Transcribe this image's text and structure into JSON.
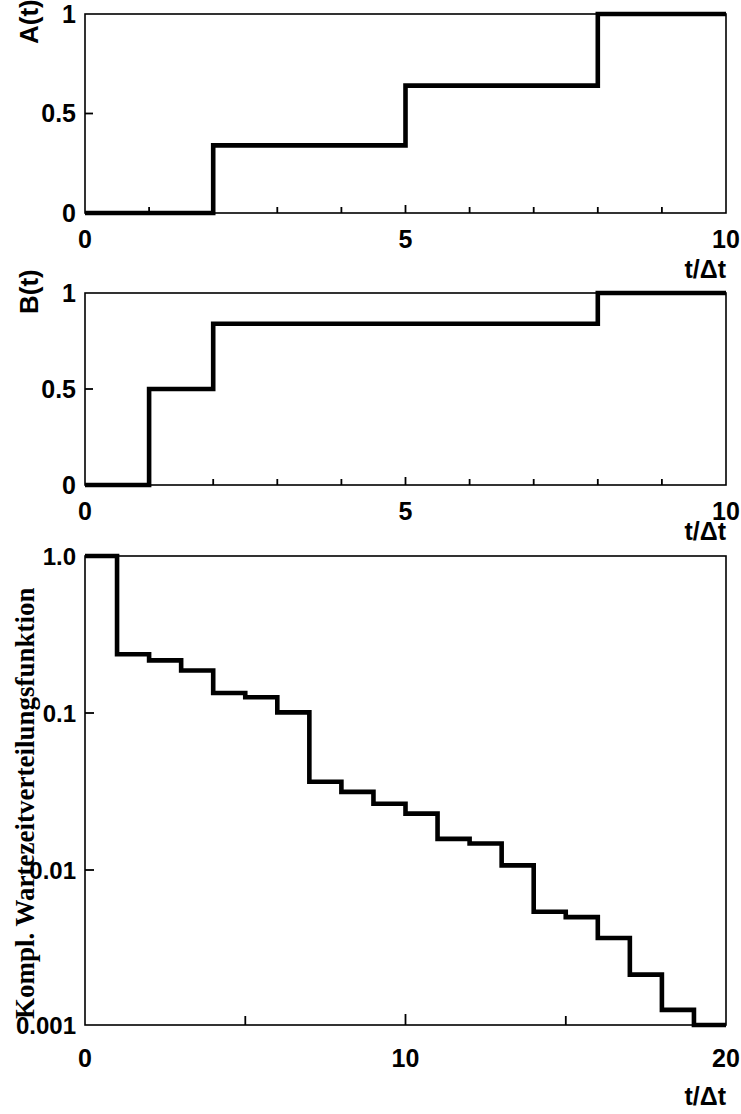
{
  "figure": {
    "background": "#ffffff",
    "ink": "#000000"
  },
  "panels": {
    "a": {
      "ylabel": "A(t)",
      "xlabel": "t/Δt",
      "y_ticks": [
        "0",
        "0.5",
        "1"
      ],
      "x_ticks": [
        "0",
        "5",
        "10"
      ]
    },
    "b": {
      "ylabel": "B(t)",
      "xlabel": "t/Δt",
      "y_ticks": [
        "0",
        "0.5",
        "1"
      ],
      "x_ticks": [
        "0",
        "5",
        "10"
      ]
    },
    "c": {
      "ylabel": "Kompl. Wartezeitverteilungsfunktion",
      "xlabel": "t/Δt",
      "y_ticks": [
        "0.001",
        "0.01",
        "0.1",
        "1.0"
      ],
      "x_ticks": [
        "0",
        "10",
        "20"
      ]
    }
  },
  "chart_data": [
    {
      "type": "line",
      "id": "panel-a",
      "title": "",
      "subtitle": "",
      "xlabel": "t/Δt",
      "ylabel": "A(t)",
      "xlim": [
        0,
        10
      ],
      "ylim": [
        0,
        1
      ],
      "xscale": "linear",
      "yscale": "linear",
      "xticks": [
        0,
        5,
        10
      ],
      "xticklabels": [
        "0",
        "5",
        "10"
      ],
      "yticks": [
        0,
        0.5,
        1
      ],
      "yticklabels": [
        "0",
        "0.5",
        "1"
      ],
      "minor_xticks": [
        1,
        2,
        3,
        4,
        6,
        7,
        8,
        9
      ],
      "grid": false,
      "legend": false,
      "drawstyle": "steps-post",
      "x": [
        0,
        2,
        5,
        8,
        10
      ],
      "y": [
        0,
        0.34,
        0.64,
        1.0,
        1.0
      ],
      "steps": [
        {
          "x": 0,
          "y": 0.0
        },
        {
          "x": 2,
          "y": 0.34
        },
        {
          "x": 5,
          "y": 0.64
        },
        {
          "x": 8,
          "y": 1.0
        },
        {
          "x": 10,
          "y": 1.0
        }
      ]
    },
    {
      "type": "line",
      "id": "panel-b",
      "title": "",
      "subtitle": "",
      "xlabel": "t/Δt",
      "ylabel": "B(t)",
      "xlim": [
        0,
        10
      ],
      "ylim": [
        0,
        1
      ],
      "xscale": "linear",
      "yscale": "linear",
      "xticks": [
        0,
        5,
        10
      ],
      "xticklabels": [
        "0",
        "5",
        "10"
      ],
      "yticks": [
        0,
        0.5,
        1
      ],
      "yticklabels": [
        "0",
        "0.5",
        "1"
      ],
      "minor_xticks": [
        1,
        2,
        3,
        4,
        6,
        7,
        8,
        9
      ],
      "grid": false,
      "legend": false,
      "drawstyle": "steps-post",
      "x": [
        0,
        1,
        2,
        8,
        10
      ],
      "y": [
        0,
        0.5,
        0.84,
        1.0,
        1.0
      ],
      "steps": [
        {
          "x": 0,
          "y": 0.0
        },
        {
          "x": 1,
          "y": 0.5
        },
        {
          "x": 2,
          "y": 0.84
        },
        {
          "x": 8,
          "y": 1.0
        },
        {
          "x": 10,
          "y": 1.0
        }
      ]
    },
    {
      "type": "line",
      "id": "panel-c",
      "title": "",
      "subtitle": "",
      "xlabel": "t/Δt",
      "ylabel": "Kompl. Wartezeitverteilungsfunktion",
      "xlim": [
        0,
        20
      ],
      "ylim": [
        0.001,
        1.0
      ],
      "xscale": "linear",
      "yscale": "log",
      "xticks": [
        0,
        10,
        20
      ],
      "xticklabels": [
        "0",
        "10",
        "20"
      ],
      "minor_xticks": [
        5,
        15
      ],
      "yticks": [
        0.001,
        0.01,
        0.1,
        1.0
      ],
      "yticklabels": [
        "0.001",
        "0.01",
        "0.1",
        "1.0"
      ],
      "grid": false,
      "legend": false,
      "drawstyle": "steps-post",
      "x": [
        0,
        1,
        2,
        3,
        4,
        5,
        6,
        7,
        8,
        9,
        10,
        11,
        12,
        13,
        14,
        15,
        16,
        17,
        18,
        19
      ],
      "y": [
        1.0,
        0.235,
        0.215,
        0.185,
        0.133,
        0.125,
        0.1,
        0.036,
        0.031,
        0.026,
        0.0225,
        0.0155,
        0.0145,
        0.0105,
        0.0053,
        0.0049,
        0.0036,
        0.0021,
        0.00125,
        0.001
      ],
      "steps": [
        {
          "x": 0,
          "y": 1.0
        },
        {
          "x": 1,
          "y": 0.235
        },
        {
          "x": 2,
          "y": 0.215
        },
        {
          "x": 3,
          "y": 0.185
        },
        {
          "x": 4,
          "y": 0.133
        },
        {
          "x": 5,
          "y": 0.125
        },
        {
          "x": 6,
          "y": 0.1
        },
        {
          "x": 7,
          "y": 0.036
        },
        {
          "x": 8,
          "y": 0.031
        },
        {
          "x": 9,
          "y": 0.026
        },
        {
          "x": 10,
          "y": 0.0225
        },
        {
          "x": 11,
          "y": 0.0155
        },
        {
          "x": 12,
          "y": 0.0145
        },
        {
          "x": 13,
          "y": 0.0105
        },
        {
          "x": 14,
          "y": 0.0053
        },
        {
          "x": 15,
          "y": 0.0049
        },
        {
          "x": 16,
          "y": 0.0036
        },
        {
          "x": 17,
          "y": 0.0021
        },
        {
          "x": 18,
          "y": 0.00125
        },
        {
          "x": 19,
          "y": 0.001
        }
      ]
    }
  ]
}
